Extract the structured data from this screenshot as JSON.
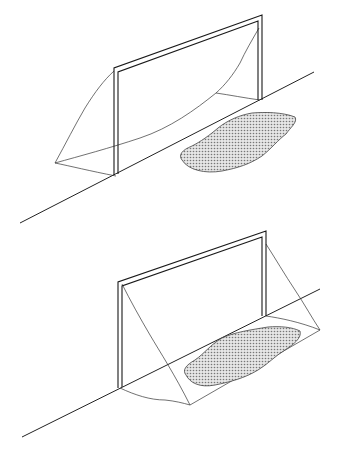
{
  "figure": {
    "description": "Two line drawings of a soccer goal on a ground line with a shaded patch",
    "panels": [
      {
        "id": "top",
        "label": "Goal with shaded patch in front of goal line"
      },
      {
        "id": "bottom",
        "label": "Goal with shaded patch inside net behind goal line"
      }
    ],
    "colors": {
      "line": "#222222",
      "frame": "#1a1a1a",
      "patch_fill": "#bdbdbd",
      "background": "#ffffff"
    }
  }
}
